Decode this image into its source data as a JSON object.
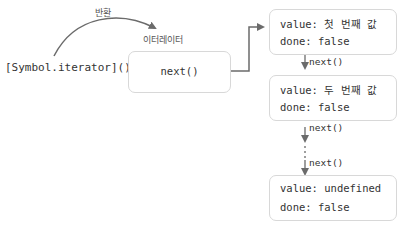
{
  "diagram": {
    "return_label": "반환",
    "call_label": "[Symbol.iterator]()",
    "iterator_label": "이터레이터",
    "iterator_box": {
      "method": "next()"
    },
    "results": [
      {
        "value_line": "value: 첫 번째 값",
        "done_line": "done: false"
      },
      {
        "value_line": "value: 두 번째 값",
        "done_line": "done: false"
      },
      {
        "value_line": "value: undefined",
        "done_line": "done: false"
      }
    ],
    "arrows": [
      {
        "label": "next()"
      },
      {
        "label": "next()"
      },
      {
        "label": "next()"
      }
    ],
    "colors": {
      "arrow": "#6b6b6b",
      "box_border": "#d8d8d8",
      "text": "#333333"
    }
  }
}
